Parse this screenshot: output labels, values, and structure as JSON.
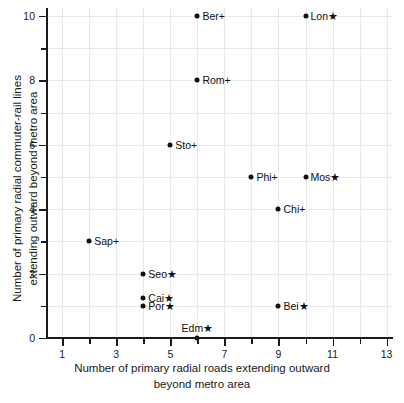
{
  "chart_data": {
    "type": "scatter",
    "title": "",
    "xlabel_line1": "Number of primary radial roads extending outward",
    "xlabel_line2": "beyond metro area",
    "ylabel_line1": "Number of primary radial commuter-rail lines",
    "ylabel_line2": "extending outward beyond metro area",
    "xlim": [
      0.4,
      13.2
    ],
    "ylim": [
      0,
      10.25
    ],
    "grid": true,
    "legend": "none",
    "x_major_ticks": [
      1,
      3,
      5,
      7,
      9,
      11,
      13
    ],
    "x_minor_ticks": [
      2,
      4,
      6,
      8,
      10,
      12
    ],
    "y_major_ticks": [
      0,
      2,
      4,
      6,
      8,
      10
    ],
    "y_minor_ticks": [
      1,
      3,
      5,
      7,
      9
    ],
    "x_tick_labels": [
      "1",
      "3",
      "5",
      "7",
      "9",
      "11",
      "13"
    ],
    "y_tick_labels": [
      "0",
      "2",
      "4",
      "6",
      "8",
      "10"
    ],
    "marker": "filled-circle",
    "marker_color": "#111111",
    "grid_color": "#e9e9ec",
    "axis_color": "#1a1a1a",
    "points": [
      {
        "label": "Ber+",
        "x": 6,
        "y": 10,
        "label_pos": "right"
      },
      {
        "label": "Lon★",
        "x": 10,
        "y": 10,
        "label_pos": "right"
      },
      {
        "label": "Rom+",
        "x": 6,
        "y": 8,
        "label_pos": "right"
      },
      {
        "label": "Sto+",
        "x": 5,
        "y": 6,
        "label_pos": "right"
      },
      {
        "label": "Phi+",
        "x": 8,
        "y": 5,
        "label_pos": "right"
      },
      {
        "label": "Mos★",
        "x": 10,
        "y": 5,
        "label_pos": "right"
      },
      {
        "label": "Chi+",
        "x": 9,
        "y": 4,
        "label_pos": "right"
      },
      {
        "label": "Sap+",
        "x": 2,
        "y": 3,
        "label_pos": "right"
      },
      {
        "label": "Seo★",
        "x": 4,
        "y": 2,
        "label_pos": "right"
      },
      {
        "label": "Cai★",
        "x": 4,
        "y": 1.25,
        "label_pos": "right"
      },
      {
        "label": "Por★",
        "x": 4,
        "y": 1,
        "label_pos": "right"
      },
      {
        "label": "Bei★",
        "x": 9,
        "y": 1,
        "label_pos": "right"
      },
      {
        "label": "Edm★",
        "x": 6,
        "y": 0,
        "label_pos": "above"
      }
    ]
  }
}
